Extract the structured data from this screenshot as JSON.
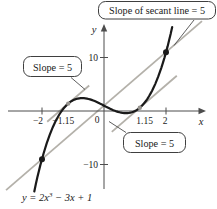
{
  "figure": {
    "colors": {
      "background": "#ffffff",
      "curve": "#1a1a1a",
      "secant_gray": "#b4b1aa",
      "axis": "#4d4d4d",
      "text": "#1a1a1a",
      "callout_border": "#3f3f3f",
      "tangent_point_gray": "#96938e"
    }
  },
  "chart_data": {
    "type": "line",
    "title": "",
    "function": {
      "expression": "y = 2x^3 - 3x + 1",
      "coefficients": [
        2,
        0,
        -3,
        1
      ],
      "x_range": [
        -2.25,
        2.2
      ],
      "display": {
        "pre": "y = 2x",
        "sup": "3",
        "post": " − 3x + 1"
      }
    },
    "axes": {
      "x_label": "x",
      "y_label": "y",
      "origin_label": "0",
      "xlim": [
        -3.2,
        3.3
      ],
      "ylim": [
        -16,
        18
      ],
      "grid": false,
      "x_ticks": [
        {
          "value": -2,
          "label": "−2"
        },
        {
          "value": 2,
          "label": "2"
        }
      ],
      "x_point_labels": [
        {
          "value": -1.15,
          "label": "−1.15"
        },
        {
          "value": 1.15,
          "label": "1.15"
        }
      ],
      "y_ticks": [
        {
          "value": 10,
          "label": "10"
        },
        {
          "value": -10,
          "label": "−10"
        }
      ]
    },
    "secant": {
      "slope": 5,
      "points": [
        [
          -2,
          -9
        ],
        [
          2,
          11
        ]
      ],
      "label": "Slope of secant line = 5"
    },
    "tangents": [
      {
        "x": -1.1547,
        "y": 1.3849,
        "slope": 5,
        "label": "Slope = 5"
      },
      {
        "x": 1.1547,
        "y": 0.6151,
        "slope": 5,
        "label": "Slope = 5"
      }
    ]
  }
}
